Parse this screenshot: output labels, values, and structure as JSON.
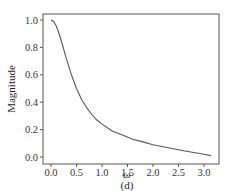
{
  "chart_data": {
    "type": "line",
    "title": "",
    "caption": "(d)",
    "xlabel": "ω",
    "ylabel": "Magnitude",
    "xlim": [
      -0.13,
      3.27
    ],
    "ylim": [
      -0.05,
      1.05
    ],
    "grid": false,
    "legend": null,
    "xticks": [
      0.0,
      0.5,
      1.0,
      1.5,
      2.0,
      2.5,
      3.0
    ],
    "xtick_labels": [
      "0.0",
      "0.5",
      "1.0",
      "1.5",
      "2.0",
      "2.5",
      "3.0"
    ],
    "yticks": [
      0.0,
      0.2,
      0.4,
      0.6,
      0.8,
      1.0
    ],
    "ytick_labels": [
      "0.0",
      "0.2",
      "0.4",
      "0.6",
      "0.8",
      "1.0"
    ],
    "series": [
      {
        "name": "Magnitude",
        "color": "#555555",
        "x": [
          0.0,
          0.05,
          0.1,
          0.15,
          0.2,
          0.3,
          0.4,
          0.5,
          0.6,
          0.7,
          0.8,
          0.9,
          1.0,
          1.2,
          1.4,
          1.6,
          1.8,
          2.0,
          2.2,
          2.4,
          2.6,
          2.8,
          3.0,
          3.14
        ],
        "y": [
          1.0,
          0.99,
          0.96,
          0.91,
          0.85,
          0.72,
          0.6,
          0.5,
          0.42,
          0.36,
          0.31,
          0.27,
          0.24,
          0.19,
          0.16,
          0.13,
          0.11,
          0.09,
          0.075,
          0.06,
          0.045,
          0.033,
          0.02,
          0.01
        ]
      }
    ]
  }
}
